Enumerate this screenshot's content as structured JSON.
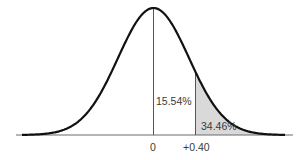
{
  "chart_data": {
    "type": "area",
    "title": "",
    "xlabel": "",
    "ylabel": "",
    "tick_labels": [
      "0",
      "+0.40"
    ],
    "mean_z": 0,
    "cutoff_z": 0.4,
    "regions": [
      {
        "name": "between mean and z",
        "from": 0,
        "to": 0.4,
        "percent": 15.54,
        "label": "15.54%"
      },
      {
        "name": "tail beyond z",
        "from": 0.4,
        "to": "inf",
        "percent": 34.46,
        "label": "34.46%",
        "shaded": true
      }
    ],
    "grid": false,
    "legend": null
  },
  "labels": {
    "between": "15.54%",
    "tail": "34.46%",
    "tick_zero": "0",
    "tick_z": "+0.40"
  },
  "colors": {
    "curve": "#111111",
    "shade": "#d9d9d9",
    "axis": "#6b6b6b",
    "line": "#555555"
  }
}
